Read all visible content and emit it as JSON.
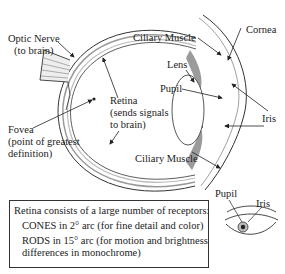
{
  "diagram": {
    "labels": {
      "optic_nerve": [
        "Optic Nerve",
        "(to brain)"
      ],
      "fovea": [
        "Fovea",
        "(point of greatest",
        "definition)"
      ],
      "retina": [
        "Retina",
        "(sends signals",
        "to brain)"
      ],
      "ciliary_muscle_top": "Ciliary Muscle",
      "ciliary_muscle_bottom": "Ciliary Muscle",
      "lens": "Lens",
      "pupil": "Pupil",
      "cornea": "Cornea",
      "iris": "Iris",
      "small_eye_pupil": "Pupil",
      "small_eye_iris": "Iris"
    },
    "info_box": {
      "title": "Retina consists of a large number of receptors:",
      "cones": "CONES in 2° arc (for fine detail and color)",
      "rods_line1": "RODS in 15° arc (for motion and brightness",
      "rods_line2": "differences in monochrome)"
    },
    "colors": {
      "line": "#333333",
      "muscle": "#8a8a8a",
      "retina_band": "#bdbdbd"
    }
  }
}
